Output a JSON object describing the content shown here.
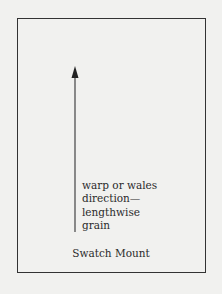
{
  "diagram": {
    "arrow_label_lines": [
      "warp or wales",
      "direction—",
      "lengthwise",
      "grain"
    ],
    "caption": "Swatch Mount",
    "colors": {
      "background": "#f1f1ef",
      "stroke": "#333333",
      "text": "#2b2b2b"
    }
  }
}
